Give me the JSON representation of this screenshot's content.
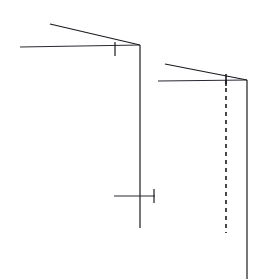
{
  "document": {
    "title": "Technical line drawing",
    "description": "Two similar wireframe structures drawn in thin dark lines on a white background: each has two converging near-horizontal members meeting at a corner vertex with a vertical post descending from it.",
    "width": 271,
    "height": 279,
    "background_color": "#ffffff",
    "stroke_color": "#1a1a22",
    "stroke_color_light": "#4a4a55"
  },
  "chart_data": {
    "type": "line",
    "xlabel": "",
    "ylabel": "",
    "xlim": [
      0,
      271
    ],
    "ylim": [
      0,
      279
    ],
    "grid": false,
    "legend": "none",
    "series": [
      {
        "name": "left-upper-member",
        "style": "solid",
        "width": 1.1,
        "color": "#1a1a22",
        "points": [
          [
            50,
            24
          ],
          [
            140,
            45
          ]
        ]
      },
      {
        "name": "left-lower-member",
        "style": "solid",
        "width": 1.1,
        "color": "#2a2a33",
        "points": [
          [
            20,
            47
          ],
          [
            140,
            45
          ]
        ]
      },
      {
        "name": "left-vertical-post",
        "style": "solid",
        "width": 1.2,
        "color": "#1a1a22",
        "points": [
          [
            140,
            45
          ],
          [
            140,
            228
          ]
        ]
      },
      {
        "name": "left-vertex-tick",
        "style": "solid",
        "width": 1.2,
        "color": "#1a1a22",
        "points": [
          [
            115,
            42
          ],
          [
            115,
            56
          ]
        ]
      },
      {
        "name": "left-crossbar",
        "style": "solid",
        "width": 1.1,
        "color": "#2a2a33",
        "points": [
          [
            114,
            196
          ],
          [
            155,
            196
          ]
        ]
      },
      {
        "name": "left-crossbar-end-tick",
        "style": "solid",
        "width": 1.2,
        "color": "#1a1a22",
        "points": [
          [
            154,
            189
          ],
          [
            154,
            203
          ]
        ]
      },
      {
        "name": "right-upper-member",
        "style": "solid",
        "width": 1.1,
        "color": "#1a1a22",
        "points": [
          [
            165,
            64
          ],
          [
            247,
            80
          ]
        ]
      },
      {
        "name": "right-lower-member",
        "style": "solid",
        "width": 1.1,
        "color": "#2a2a33",
        "points": [
          [
            158,
            81
          ],
          [
            247,
            80
          ]
        ]
      },
      {
        "name": "right-vertical-post",
        "style": "solid",
        "width": 1.2,
        "color": "#1a1a22",
        "points": [
          [
            247,
            80
          ],
          [
            247,
            279
          ]
        ]
      },
      {
        "name": "right-dashed-guide",
        "style": "dashed",
        "width": 1.6,
        "color": "#1a1a22",
        "dash": [
          4,
          4
        ],
        "points": [
          [
            226,
            80
          ],
          [
            226,
            233
          ]
        ]
      },
      {
        "name": "right-vertex-tick",
        "style": "solid",
        "width": 1.6,
        "color": "#1a1a22",
        "points": [
          [
            226,
            74
          ],
          [
            226,
            86
          ]
        ]
      }
    ]
  }
}
